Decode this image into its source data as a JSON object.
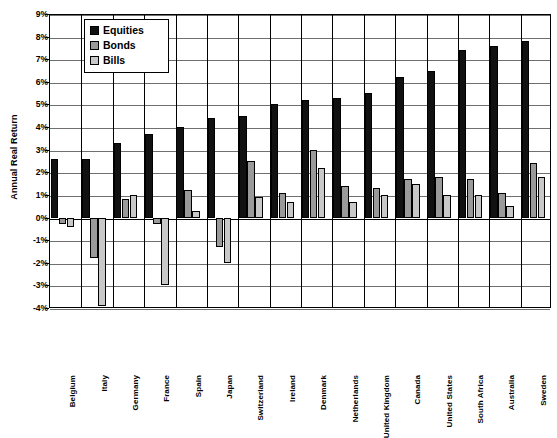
{
  "chart_data": {
    "type": "bar",
    "title": "",
    "xlabel": "",
    "ylabel": "Annual Real Return",
    "ylim": [
      -4,
      9
    ],
    "ytick_step": 1,
    "ytick_labels": [
      "9%",
      "8%",
      "7%",
      "6%",
      "5%",
      "4%",
      "3%",
      "2%",
      "1%",
      "0%",
      "-1%",
      "-2%",
      "-3%",
      "-4%"
    ],
    "grid": true,
    "legend_position": "top-left-inside",
    "categories": [
      "Belgium",
      "Italy",
      "Germany",
      "France",
      "Spain",
      "Japan",
      "Switzerland",
      "Ireland",
      "Denmark",
      "Netherlands",
      "United Kingdom",
      "Canada",
      "United States",
      "South Africa",
      "Australia",
      "Sweden"
    ],
    "series": [
      {
        "name": "Equities",
        "color": "#111111",
        "values": [
          2.6,
          2.6,
          3.3,
          3.7,
          4.0,
          4.4,
          4.5,
          5.0,
          5.2,
          5.3,
          5.5,
          6.2,
          6.5,
          7.4,
          7.6,
          7.8
        ]
      },
      {
        "name": "Bonds",
        "color": "#9a9a9a",
        "values": [
          -0.3,
          -1.8,
          0.8,
          -0.3,
          1.2,
          -1.3,
          2.5,
          1.1,
          3.0,
          1.4,
          1.3,
          1.7,
          1.8,
          1.7,
          1.1,
          2.4
        ]
      },
      {
        "name": "Bills",
        "color": "#c8c8c8",
        "values": [
          -0.4,
          -3.9,
          1.0,
          -3.0,
          0.3,
          -2.0,
          0.9,
          0.7,
          2.2,
          0.7,
          1.0,
          1.5,
          1.0,
          1.0,
          0.5,
          1.8
        ]
      }
    ]
  },
  "legend": {
    "items": [
      {
        "label": "Equities"
      },
      {
        "label": "Bonds"
      },
      {
        "label": "Bills"
      }
    ]
  }
}
